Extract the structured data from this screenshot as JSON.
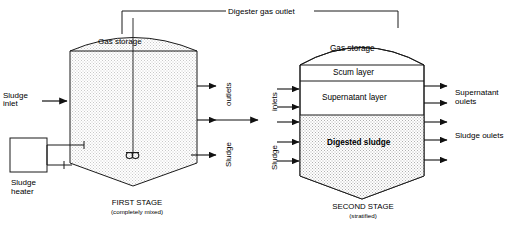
{
  "diagram": {
    "colors": {
      "line": "#1a1a1a",
      "sludge_fill": "#d9d9d9",
      "tank_fill": "#ececec",
      "background": "#ffffff",
      "text": "#000000"
    },
    "top_pipe": {
      "label": "Digester gas outlet"
    },
    "stage_one": {
      "dome_label": "Gas storage",
      "caption_title": "FIRST STAGE",
      "caption_sub": "(completely mixed)",
      "left_inlet_label_line1": "Sludge",
      "left_inlet_label_line2": "inlet",
      "heater_label_line1": "Sludge",
      "heater_label_line2": "heater",
      "right_label_top": "outlets",
      "right_label_bottom": "Sludge",
      "mixer_name": "mechanical-mixer"
    },
    "stage_two": {
      "caption_title": "SECOND STAGE",
      "caption_sub": "(stratified)",
      "layers": [
        {
          "name": "gas-storage",
          "label": "Gas storage"
        },
        {
          "name": "scum-layer",
          "label": "Scum layer"
        },
        {
          "name": "supernatant-layer",
          "label": "Supernatant layer"
        },
        {
          "name": "digested-sludge",
          "label": "Digested sludge"
        }
      ],
      "left_label_top": "inlets",
      "left_label_bottom": "Sludge",
      "right_label_top_line1": "Supernatant",
      "right_label_top_line2": "oulets",
      "right_label_bottom": "Sludge oulets"
    }
  }
}
